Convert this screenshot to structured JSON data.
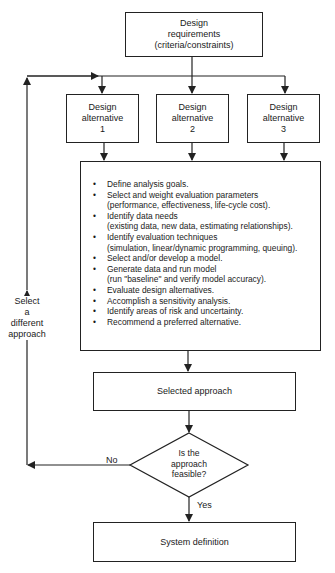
{
  "diagram": {
    "type": "flowchart",
    "nodes": {
      "requirements": {
        "label": "Design\nrequirements\n(criteria/constraints)"
      },
      "alternatives": [
        {
          "label": "Design\nalternative\n1"
        },
        {
          "label": "Design\nalternative\n2"
        },
        {
          "label": "Design\nalternative\n3"
        }
      ],
      "analysis": {
        "items": [
          "Define analysis goals.",
          "Select and weight evaluation parameters\n(performance, effectiveness, life-cycle cost).",
          "Identify data needs\n(existing data, new data, estimating relationships).",
          "Identify evaluation techniques\n(simulation, linear/dynamic programming, queuing).",
          "Select and/or develop a model.",
          "Generate data and run model\n(run \"baseline\" and verify model accuracy).",
          "Evaluate design alternatives.",
          "Accomplish a sensitivity analysis.",
          "Identify areas of risk and uncertainty.",
          "Recommend a preferred alternative."
        ]
      },
      "selected": {
        "label": "Selected approach"
      },
      "decision": {
        "label": "Is the\napproach\nfeasible?"
      },
      "system": {
        "label": "System definition"
      }
    },
    "edges": {
      "loop_label": "Select\na\ndifferent\napproach",
      "no_label": "No",
      "yes_label": "Yes"
    }
  }
}
